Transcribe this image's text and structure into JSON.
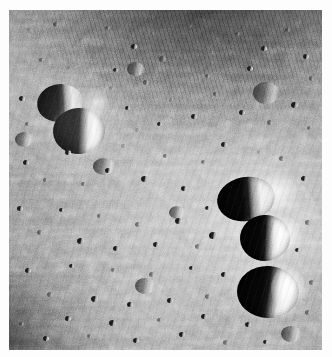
{
  "image": {
    "kind": "planetary-surface-photograph",
    "subject": "Heavily cratered lunar regolith surface",
    "color_mode": "grayscale",
    "width_px": 332,
    "height_px": 357,
    "border": {
      "color": "#ffffff",
      "inset_left_px": 9,
      "inset_top_px": 10,
      "plate_width_px": 313,
      "plate_height_px": 340
    },
    "palette": {
      "shadow_black": "#0a0a0a",
      "dark_terrain": "#3c3c3c",
      "mid_regolith": "#8c8c8c",
      "light_regolith": "#a8a8a8",
      "sunlit_rim_white": "#f2f2f2"
    },
    "illumination": {
      "sun_direction": "from the right",
      "shadow_side": "left"
    },
    "regions": [
      {
        "name": "dark-diagonal-streaked-terrain",
        "location": "upper-center to upper-right",
        "tone": "dark"
      },
      {
        "name": "dark-corner-terrain",
        "location": "lower-left corner",
        "tone": "dark"
      },
      {
        "name": "bright-ejecta-swath",
        "location": "center-right",
        "tone": "light"
      },
      {
        "name": "dense-pitted-regolith",
        "location": "center and lower-center",
        "tone": "mid"
      }
    ],
    "features": [
      {
        "name": "twin-crater-upper-left",
        "description": "Pair of overlapping craters with black shadowed floors and bright sunlit right rims",
        "approx_center_px": [
          60,
          115
        ]
      },
      {
        "name": "crater-chain-right",
        "description": "Vertical chain of three prominent bowl craters along the right side",
        "count": 3
      },
      {
        "name": "crater-upper-right-chain-1",
        "approx_center_px": [
          243,
          190
        ]
      },
      {
        "name": "crater-middle-chain-2",
        "approx_center_px": [
          257,
          227
        ]
      },
      {
        "name": "crater-lower-chain-3",
        "approx_center_px": [
          262,
          280
        ]
      },
      {
        "name": "secondary-crater-field",
        "description": "Hundreds of small dark pits scattered across the surface"
      }
    ]
  }
}
